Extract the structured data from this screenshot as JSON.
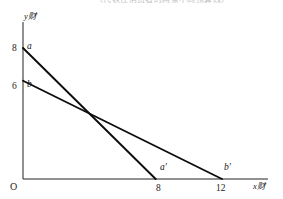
{
  "figure": {
    "caption_fragment": "〔代表性消费者的两条不同预算线〕",
    "origin_label": "O",
    "axes": {
      "x_axis_label": "x财",
      "y_axis_label": "y财",
      "x_var": "x",
      "x_unit": "财",
      "y_var": "y",
      "y_unit": "财"
    }
  },
  "chart_data": {
    "type": "line",
    "title": "",
    "xlabel": "x财",
    "ylabel": "y财",
    "xlim": [
      0,
      14.5
    ],
    "ylim": [
      0,
      9.6
    ],
    "grid": false,
    "legend": "none",
    "x_ticks": [
      8,
      12
    ],
    "x_tick_labels": [
      "8",
      "12"
    ],
    "y_ticks": [
      6,
      8
    ],
    "y_tick_labels": [
      "6",
      "8"
    ],
    "series": [
      {
        "name": "aa'",
        "start_label": "a",
        "end_label": "a′",
        "x": [
          0,
          8
        ],
        "y": [
          8,
          0
        ],
        "intercept_y": 8,
        "intercept_x": 8,
        "slope": -1
      },
      {
        "name": "bb'",
        "start_label": "b",
        "end_label": "b′",
        "x": [
          0,
          12
        ],
        "y": [
          6,
          0
        ],
        "intercept_y": 6,
        "intercept_x": 12,
        "slope": -0.5
      }
    ],
    "annotations": [
      {
        "text": "a",
        "x": 0,
        "y": 8
      },
      {
        "text": "b",
        "x": 0,
        "y": 6
      },
      {
        "text": "a′",
        "x": 8,
        "y": 0
      },
      {
        "text": "b′",
        "x": 12,
        "y": 0
      }
    ],
    "intersection": {
      "x": 4.8,
      "y": 3.2
    }
  },
  "geometry": {
    "origin_px": {
      "x": 23,
      "y": 179
    },
    "x_axis_end_px": 268,
    "y_axis_top_px": 22,
    "line_a": {
      "x1": 23,
      "y1": 48,
      "x2": 159,
      "y2": 179
    },
    "line_b": {
      "x1": 23,
      "y1": 86,
      "x2": 222,
      "y2": 179
    },
    "tick_8_x_px": 159,
    "tick_12_x_px": 222,
    "tick_8_y_px": 48,
    "tick_6_y_px": 86
  }
}
